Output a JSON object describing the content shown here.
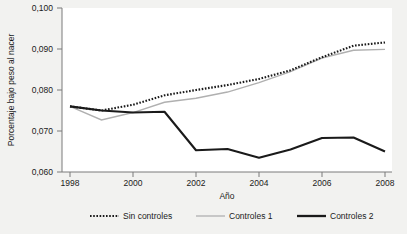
{
  "chart_data": {
    "type": "line",
    "title": "",
    "subtitle": "",
    "xlabel": "Año",
    "ylabel": "Porcentaje bajo peso al nacer",
    "x": [
      1998,
      1999,
      2000,
      2001,
      2002,
      2003,
      2004,
      2005,
      2006,
      2007,
      2008
    ],
    "xtick_labels": [
      "1998",
      "2000",
      "2002",
      "2004",
      "2006",
      "2008"
    ],
    "xticks": [
      1998,
      2000,
      2002,
      2004,
      2006,
      2008
    ],
    "xlim": [
      1998,
      2008
    ],
    "ytick_labels": [
      "0,060",
      "0,070",
      "0,080",
      "0,090",
      "0,100"
    ],
    "yticks": [
      0.06,
      0.07,
      0.08,
      0.09,
      0.1
    ],
    "ylim": [
      0.06,
      0.1
    ],
    "grid": false,
    "legend_position": "bottom",
    "series": [
      {
        "name": "Sin controles",
        "style": "dotted",
        "color": "#1a1a1a",
        "values": [
          0.076,
          0.075,
          0.0764,
          0.0787,
          0.08,
          0.0812,
          0.0827,
          0.0848,
          0.088,
          0.0908,
          0.0916
        ]
      },
      {
        "name": "Controles 1",
        "style": "solid-light",
        "color": "#b0b0b0",
        "values": [
          0.076,
          0.0727,
          0.0745,
          0.077,
          0.078,
          0.0795,
          0.0818,
          0.0845,
          0.0878,
          0.0897,
          0.0899
        ]
      },
      {
        "name": "Controles 2",
        "style": "solid-bold",
        "color": "#1a1a1a",
        "values": [
          0.076,
          0.075,
          0.0745,
          0.0747,
          0.0653,
          0.0656,
          0.0635,
          0.0655,
          0.0683,
          0.0684,
          0.065
        ]
      }
    ]
  },
  "legend": {
    "items": [
      {
        "label": "Sin controles"
      },
      {
        "label": "Controles 1"
      },
      {
        "label": "Controles 2"
      }
    ]
  }
}
